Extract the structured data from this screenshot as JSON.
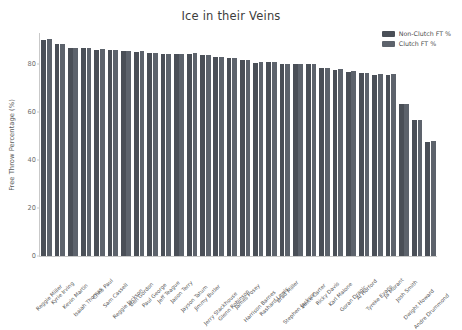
{
  "chart_data": {
    "type": "bar",
    "title": "Ice in their Veins",
    "xlabel": "",
    "ylabel": "Free Throw Percentage (%)",
    "ylim": [
      0,
      93
    ],
    "yticks": [
      0,
      20,
      40,
      60,
      80
    ],
    "grid": false,
    "legend_position": "upper right",
    "categories": [
      "Reggie Miller",
      "Kyrie Irving",
      "Kevin Martin",
      "Isaiah Thomas",
      "Chris Paul",
      "Sam Cassell",
      "Reggie Jackson",
      "Ben Gordon",
      "Paul George",
      "Jeff Teague",
      "Jason Terry",
      "Jayson Tatum",
      "Jimmy Butler",
      "Jerry Stackhouse",
      "Glenn Robinson",
      "James Posey",
      "Harrison Barnes",
      "Rashard Lewis",
      "Brad Miller",
      "Stephen Jackson",
      "Vince Carter",
      "Ricky Davis",
      "Karl Malone",
      "Goran Dragic",
      "Al Horford",
      "Tyreke Evans",
      "Ja Morant",
      "Josh Smith",
      "Dwight Howard",
      "Andre Drummond"
    ],
    "series": [
      {
        "name": "Non-Clutch FT %",
        "color": "#4a4f57",
        "values": [
          90.2,
          88.3,
          86.8,
          86.6,
          86.1,
          86.0,
          85.5,
          85.2,
          84.5,
          84.3,
          84.2,
          84.3,
          83.7,
          82.8,
          82.6,
          81.8,
          80.7,
          80.8,
          79.9,
          80.1,
          79.9,
          78.3,
          77.6,
          76.9,
          76.2,
          75.6,
          75.5,
          63.2,
          56.6,
          47.6
        ]
      },
      {
        "name": "Clutch FT %",
        "color": "#5d636c",
        "values": [
          90.4,
          88.6,
          86.9,
          86.9,
          86.3,
          86.1,
          85.6,
          85.4,
          84.6,
          84.4,
          84.3,
          84.5,
          83.9,
          82.9,
          82.7,
          81.9,
          80.9,
          80.9,
          80.1,
          80.2,
          80.1,
          78.4,
          77.8,
          77.0,
          76.4,
          75.8,
          75.7,
          63.4,
          56.8,
          47.8
        ]
      }
    ]
  },
  "legend": {
    "items": [
      {
        "label": "Non-Clutch FT %",
        "color": "#4a4f57"
      },
      {
        "label": "Clutch FT %",
        "color": "#5d636c"
      }
    ]
  }
}
